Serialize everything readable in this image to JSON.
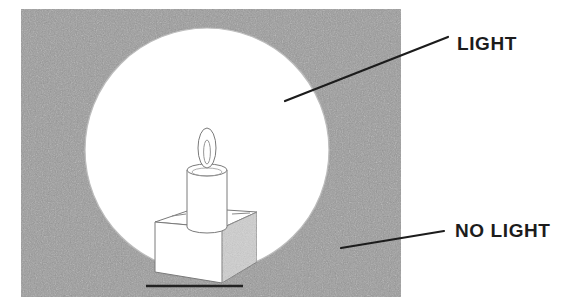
{
  "figure": {
    "type": "line-diagram",
    "canvas": {
      "width": 566,
      "height": 307,
      "background": "#ffffff"
    }
  },
  "colors": {
    "dark_region": "#9b9b9b",
    "light_region": "#ffffff",
    "outline": "#5a5a5a",
    "label_text": "#1c1c1c",
    "leader_line": "#1c1c1c",
    "box_shadow_face": "#cfcfcf",
    "ground_line": "#222222"
  },
  "regions": [
    {
      "name": "dark-region",
      "label": "NO LIGHT",
      "shape": "rectangle",
      "x": 21,
      "y": 9,
      "width": 380,
      "height": 288,
      "fill": "#9b9b9b"
    },
    {
      "name": "light-region",
      "label": "LIGHT",
      "shape": "circle",
      "cx": 207,
      "cy": 150,
      "r": 122,
      "fill": "#ffffff"
    }
  ],
  "objects": {
    "candle": {
      "name": "candle",
      "body": {
        "cx": 207,
        "top_y": 170,
        "bottom_y": 228,
        "rx": 20,
        "ry": 6
      }
    },
    "flame": {
      "name": "flame",
      "outer": {
        "cx": 207,
        "cy": 148,
        "rx": 9,
        "ry": 19
      },
      "inner": {
        "cx": 207,
        "cy": 152,
        "rx": 3.5,
        "ry": 12
      }
    },
    "box": {
      "name": "pedestal-box",
      "front_face": "#ffffff",
      "top_face": "#ffffff",
      "side_face": "#cfcfcf"
    },
    "ground_line": {
      "name": "ground-line",
      "x1": 146,
      "x2": 243,
      "y": 286
    }
  },
  "annotations": [
    {
      "id": "light",
      "text": "LIGHT",
      "text_x": 457,
      "text_y": 50,
      "leader": {
        "x1": 285,
        "y1": 101,
        "x2": 448,
        "y2": 37
      }
    },
    {
      "id": "no-light",
      "text": "NO LIGHT",
      "text_x": 455,
      "text_y": 237,
      "leader": {
        "x1": 341,
        "y1": 248,
        "x2": 444,
        "y2": 231
      }
    }
  ]
}
